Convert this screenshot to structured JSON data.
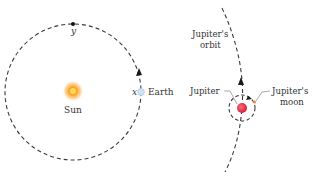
{
  "labels": {
    "sun": "Sun",
    "earth": "Earth",
    "point_x": "x",
    "point_y": "y",
    "jupiter": "Jupiter",
    "jupiter_orbit_line1": "Jupiter's",
    "jupiter_orbit_line2": "orbit",
    "jupiter_moon_line1": "Jupiter's",
    "jupiter_moon_line2": "moon"
  },
  "colors": {
    "orbit": "#3a3a3a",
    "sun_core": "#f7a21b",
    "sun_glow": "#fbd08a",
    "earth": "#cfe3f5",
    "jupiter": "#e8334a",
    "moon": "#f08a3c",
    "label": "#333333"
  }
}
